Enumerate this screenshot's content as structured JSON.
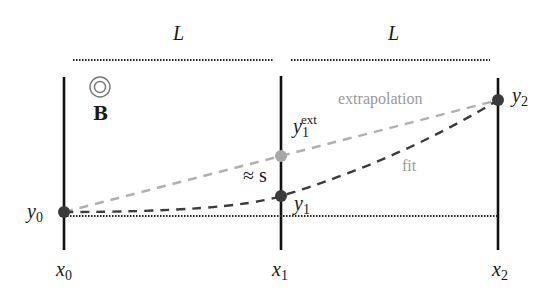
{
  "labels": {
    "span_left": "L",
    "span_right": "L",
    "field_symbol": "B",
    "extrapolation": "extrapolation",
    "fit": "fit",
    "approx_s": "≈ s",
    "y0": {
      "base": "y",
      "sub": "0"
    },
    "y1": {
      "base": "y",
      "sub": "1"
    },
    "y2": {
      "base": "y",
      "sub": "2"
    },
    "y1ext": {
      "base": "y",
      "sub": "1",
      "sup": "ext"
    },
    "x0": {
      "base": "x",
      "sub": "0"
    },
    "x1": {
      "base": "x",
      "sub": "1"
    },
    "x2": {
      "base": "x",
      "sub": "2"
    }
  },
  "colors": {
    "line": "#111111",
    "measured_point": "#3a3a3a",
    "extrapolated_point": "#a8a8a8",
    "extrapolation_dash": "#b0b0b0",
    "fit_dash": "#3c3c3c",
    "label_gray": "#9a9a9a"
  },
  "geometry": {
    "planes_x": [
      64,
      281,
      498
    ],
    "points": {
      "y0": [
        64,
        212
      ],
      "y1": [
        281,
        196
      ],
      "y1ext": [
        281,
        156
      ],
      "y2": [
        498,
        100
      ]
    },
    "baseline_y": 216
  }
}
